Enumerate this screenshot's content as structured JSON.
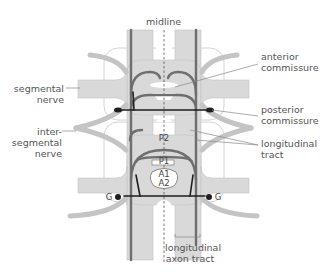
{
  "diagram": {
    "title": "",
    "labels": {
      "midline": "midline",
      "anterior_commissure": [
        "anterior",
        "commissure"
      ],
      "posterior_commissure": [
        "posterior",
        "commissure"
      ],
      "longitudinal_tract": [
        "longitudinal",
        "tract"
      ],
      "segmental_nerve": [
        "segmental",
        "nerve"
      ],
      "intersegmental_nerve": [
        "inter-",
        "segmental",
        "nerve"
      ],
      "longitudinal_axon_tract": [
        "longitudinal",
        "axon tract"
      ]
    },
    "neurons": {
      "p2": "P2",
      "p1": "P1",
      "a1": "A1",
      "a2": "A2",
      "g_left": "G",
      "g_right": "G"
    },
    "colors": {
      "tissue": "#d9d9d9",
      "tissue_outline": "#bdbdbd",
      "axon": "#6e6e6e",
      "axon_dark": "#1e1e1e",
      "label": "#555555",
      "leader": "#888888"
    }
  }
}
